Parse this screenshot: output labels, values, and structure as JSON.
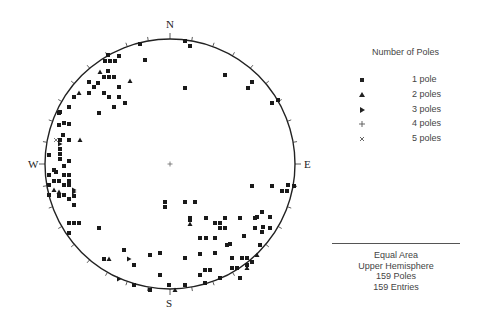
{
  "stereonet": {
    "center": [
      170,
      164
    ],
    "radius": 125,
    "labels": {
      "north": "N",
      "south": "S",
      "east": "E",
      "west": "W"
    },
    "projection": "Equal Area",
    "hemisphere": "Upper Hemisphere",
    "colors": {
      "ink": "#1a1a1a",
      "circle": "#222222"
    }
  },
  "legend": {
    "title": "Number of Poles",
    "items": [
      {
        "symbol": "square",
        "label": "1 pole"
      },
      {
        "symbol": "triangle-up",
        "label": "2 poles"
      },
      {
        "symbol": "triangle-right",
        "label": "3 poles"
      },
      {
        "symbol": "plus",
        "label": "4 poles"
      },
      {
        "symbol": "cross",
        "label": "5 poles"
      }
    ]
  },
  "info": {
    "line1": "Equal Area",
    "line2": "Upper Hemisphere",
    "line3": "159 Poles",
    "line4": "159 Entries"
  },
  "chart_data": {
    "type": "scatter",
    "xlabel": "",
    "ylabel": "",
    "note": "Pixel coordinates of pole symbols in the stereonet (center 170,164; radius 125)",
    "points": [
      {
        "x": 185,
        "y": 41,
        "s": "square"
      },
      {
        "x": 190,
        "y": 46,
        "s": "square"
      },
      {
        "x": 140,
        "y": 44,
        "s": "square"
      },
      {
        "x": 145,
        "y": 60,
        "s": "square"
      },
      {
        "x": 225,
        "y": 75,
        "s": "square"
      },
      {
        "x": 185,
        "y": 88,
        "s": "square"
      },
      {
        "x": 248,
        "y": 88,
        "s": "square"
      },
      {
        "x": 252,
        "y": 82,
        "s": "square"
      },
      {
        "x": 272,
        "y": 103,
        "s": "square"
      },
      {
        "x": 278,
        "y": 100,
        "s": "square"
      },
      {
        "x": 108,
        "y": 55,
        "s": "square"
      },
      {
        "x": 105,
        "y": 61,
        "s": "square"
      },
      {
        "x": 110,
        "y": 61,
        "s": "square"
      },
      {
        "x": 115,
        "y": 61,
        "s": "square"
      },
      {
        "x": 119,
        "y": 56,
        "s": "square"
      },
      {
        "x": 100,
        "y": 72,
        "s": "triangle-up"
      },
      {
        "x": 108,
        "y": 71,
        "s": "square"
      },
      {
        "x": 104,
        "y": 77,
        "s": "square"
      },
      {
        "x": 109,
        "y": 77,
        "s": "square"
      },
      {
        "x": 114,
        "y": 77,
        "s": "square"
      },
      {
        "x": 130,
        "y": 81,
        "s": "triangle-up"
      },
      {
        "x": 89,
        "y": 82,
        "s": "square"
      },
      {
        "x": 98,
        "y": 83,
        "s": "square"
      },
      {
        "x": 94,
        "y": 87,
        "s": "square"
      },
      {
        "x": 119,
        "y": 87,
        "s": "square"
      },
      {
        "x": 79,
        "y": 93,
        "s": "triangle-up"
      },
      {
        "x": 89,
        "y": 93,
        "s": "square"
      },
      {
        "x": 104,
        "y": 93,
        "s": "square"
      },
      {
        "x": 74,
        "y": 97,
        "s": "square"
      },
      {
        "x": 109,
        "y": 97,
        "s": "square"
      },
      {
        "x": 119,
        "y": 97,
        "s": "square"
      },
      {
        "x": 125,
        "y": 103,
        "s": "square"
      },
      {
        "x": 69,
        "y": 107,
        "s": "square"
      },
      {
        "x": 114,
        "y": 107,
        "s": "square"
      },
      {
        "x": 59,
        "y": 113,
        "s": "square"
      },
      {
        "x": 99,
        "y": 113,
        "s": "square"
      },
      {
        "x": 64,
        "y": 123,
        "s": "square"
      },
      {
        "x": 60,
        "y": 112,
        "s": "square"
      },
      {
        "x": 99,
        "y": 113,
        "s": "square"
      },
      {
        "x": 59,
        "y": 125,
        "s": "square"
      },
      {
        "x": 69,
        "y": 124,
        "s": "square"
      },
      {
        "x": 63,
        "y": 135,
        "s": "square"
      },
      {
        "x": 56,
        "y": 140,
        "s": "cross"
      },
      {
        "x": 60,
        "y": 140,
        "s": "square"
      },
      {
        "x": 60,
        "y": 144,
        "s": "triangle-right"
      },
      {
        "x": 69,
        "y": 140,
        "s": "square"
      },
      {
        "x": 80,
        "y": 140,
        "s": "triangle-up"
      },
      {
        "x": 60,
        "y": 149,
        "s": "square"
      },
      {
        "x": 49,
        "y": 155,
        "s": "square"
      },
      {
        "x": 60,
        "y": 154,
        "s": "square"
      },
      {
        "x": 60,
        "y": 159,
        "s": "square"
      },
      {
        "x": 69,
        "y": 161,
        "s": "square"
      },
      {
        "x": 64,
        "y": 166,
        "s": "square"
      },
      {
        "x": 54,
        "y": 170,
        "s": "square"
      },
      {
        "x": 56,
        "y": 172,
        "s": "square"
      },
      {
        "x": 64,
        "y": 175,
        "s": "square"
      },
      {
        "x": 59,
        "y": 181,
        "s": "square"
      },
      {
        "x": 69,
        "y": 181,
        "s": "square"
      },
      {
        "x": 64,
        "y": 185,
        "s": "square"
      },
      {
        "x": 49,
        "y": 175,
        "s": "square"
      },
      {
        "x": 49,
        "y": 185,
        "s": "square"
      },
      {
        "x": 69,
        "y": 175,
        "s": "square"
      },
      {
        "x": 69,
        "y": 185,
        "s": "square"
      },
      {
        "x": 74,
        "y": 190,
        "s": "triangle-right"
      },
      {
        "x": 49,
        "y": 195,
        "s": "square"
      },
      {
        "x": 54,
        "y": 181,
        "s": "square"
      },
      {
        "x": 59,
        "y": 196,
        "s": "square"
      },
      {
        "x": 64,
        "y": 195,
        "s": "square"
      },
      {
        "x": 74,
        "y": 205,
        "s": "square"
      },
      {
        "x": 69,
        "y": 199,
        "s": "square"
      },
      {
        "x": 54,
        "y": 190,
        "s": "triangle-up"
      },
      {
        "x": 59,
        "y": 192,
        "s": "triangle-up"
      },
      {
        "x": 74,
        "y": 192,
        "s": "triangle-right"
      },
      {
        "x": 74,
        "y": 196,
        "s": "square"
      },
      {
        "x": 69,
        "y": 223,
        "s": "square"
      },
      {
        "x": 74,
        "y": 223,
        "s": "square"
      },
      {
        "x": 79,
        "y": 223,
        "s": "square"
      },
      {
        "x": 69,
        "y": 233,
        "s": "square"
      },
      {
        "x": 99,
        "y": 228,
        "s": "square"
      },
      {
        "x": 124,
        "y": 250,
        "s": "square"
      },
      {
        "x": 104,
        "y": 259,
        "s": "square"
      },
      {
        "x": 109,
        "y": 259,
        "s": "triangle-up"
      },
      {
        "x": 129,
        "y": 259,
        "s": "triangle-right"
      },
      {
        "x": 150,
        "y": 255,
        "s": "square"
      },
      {
        "x": 134,
        "y": 265,
        "s": "square"
      },
      {
        "x": 160,
        "y": 253,
        "s": "square"
      },
      {
        "x": 160,
        "y": 275,
        "s": "square"
      },
      {
        "x": 119,
        "y": 279,
        "s": "triangle-right"
      },
      {
        "x": 134,
        "y": 285,
        "s": "square"
      },
      {
        "x": 150,
        "y": 290,
        "s": "square"
      },
      {
        "x": 169,
        "y": 285,
        "s": "square"
      },
      {
        "x": 175,
        "y": 290,
        "s": "triangle-up"
      },
      {
        "x": 165,
        "y": 202,
        "s": "square"
      },
      {
        "x": 165,
        "y": 207,
        "s": "square"
      },
      {
        "x": 185,
        "y": 202,
        "s": "square"
      },
      {
        "x": 195,
        "y": 202,
        "s": "square"
      },
      {
        "x": 252,
        "y": 186,
        "s": "square"
      },
      {
        "x": 272,
        "y": 186,
        "s": "square"
      },
      {
        "x": 288,
        "y": 185,
        "s": "square"
      },
      {
        "x": 282,
        "y": 191,
        "s": "square"
      },
      {
        "x": 287,
        "y": 191,
        "s": "square"
      },
      {
        "x": 294,
        "y": 186,
        "s": "square"
      },
      {
        "x": 206,
        "y": 218,
        "s": "square"
      },
      {
        "x": 225,
        "y": 218,
        "s": "square"
      },
      {
        "x": 240,
        "y": 218,
        "s": "square"
      },
      {
        "x": 262,
        "y": 212,
        "s": "square"
      },
      {
        "x": 263,
        "y": 227,
        "s": "square"
      },
      {
        "x": 190,
        "y": 218,
        "s": "square"
      },
      {
        "x": 230,
        "y": 244,
        "s": "square"
      },
      {
        "x": 255,
        "y": 218,
        "s": "square"
      },
      {
        "x": 244,
        "y": 236,
        "s": "square"
      },
      {
        "x": 190,
        "y": 220,
        "s": "square"
      },
      {
        "x": 190,
        "y": 224,
        "s": "triangle-up"
      },
      {
        "x": 215,
        "y": 223,
        "s": "square"
      },
      {
        "x": 220,
        "y": 228,
        "s": "square"
      },
      {
        "x": 225,
        "y": 228,
        "s": "square"
      },
      {
        "x": 220,
        "y": 223,
        "s": "square"
      },
      {
        "x": 257,
        "y": 217,
        "s": "square"
      },
      {
        "x": 270,
        "y": 217,
        "s": "square"
      },
      {
        "x": 270,
        "y": 228,
        "s": "square"
      },
      {
        "x": 262,
        "y": 232,
        "s": "square"
      },
      {
        "x": 255,
        "y": 228,
        "s": "square"
      },
      {
        "x": 200,
        "y": 238,
        "s": "square"
      },
      {
        "x": 206,
        "y": 238,
        "s": "square"
      },
      {
        "x": 215,
        "y": 238,
        "s": "square"
      },
      {
        "x": 227,
        "y": 245,
        "s": "square"
      },
      {
        "x": 200,
        "y": 254,
        "s": "square"
      },
      {
        "x": 215,
        "y": 253,
        "s": "square"
      },
      {
        "x": 185,
        "y": 258,
        "s": "square"
      },
      {
        "x": 232,
        "y": 258,
        "s": "square"
      },
      {
        "x": 242,
        "y": 258,
        "s": "square"
      },
      {
        "x": 247,
        "y": 258,
        "s": "square"
      },
      {
        "x": 257,
        "y": 255,
        "s": "triangle-up"
      },
      {
        "x": 205,
        "y": 270,
        "s": "square"
      },
      {
        "x": 210,
        "y": 270,
        "s": "square"
      },
      {
        "x": 232,
        "y": 268,
        "s": "square"
      },
      {
        "x": 237,
        "y": 268,
        "s": "square"
      },
      {
        "x": 200,
        "y": 275,
        "s": "square"
      },
      {
        "x": 220,
        "y": 278,
        "s": "square"
      },
      {
        "x": 247,
        "y": 265,
        "s": "square"
      },
      {
        "x": 240,
        "y": 278,
        "s": "square"
      },
      {
        "x": 252,
        "y": 262,
        "s": "square"
      },
      {
        "x": 185,
        "y": 285,
        "s": "square"
      },
      {
        "x": 205,
        "y": 283,
        "s": "square"
      },
      {
        "x": 247,
        "y": 268,
        "s": "triangle-up"
      },
      {
        "x": 260,
        "y": 245,
        "s": "square"
      },
      {
        "x": 170,
        "y": 164,
        "s": "plus"
      }
    ]
  }
}
